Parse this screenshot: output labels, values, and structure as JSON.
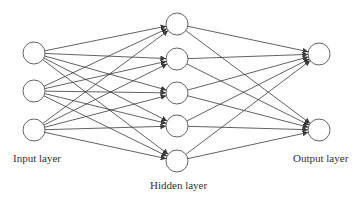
{
  "diagram": {
    "type": "feedforward-neural-network",
    "colors": {
      "line": "#3a3a3a",
      "node_fill": "#ffffff",
      "node_stroke": "#555555",
      "text": "#333333"
    },
    "node_radius": 11,
    "layers": [
      {
        "id": "input",
        "label": "Input layer",
        "x": 34,
        "nodes_y": [
          53,
          91,
          130
        ],
        "label_pos": [
          13,
          152
        ]
      },
      {
        "id": "hidden",
        "label": "Hidden layer",
        "x": 177,
        "nodes_y": [
          24,
          59,
          93,
          126,
          161
        ],
        "label_pos": [
          150,
          179
        ]
      },
      {
        "id": "output",
        "label": "Output layer",
        "x": 319,
        "nodes_y": [
          54,
          130
        ],
        "label_pos": [
          293,
          152
        ]
      }
    ],
    "connections": "fully-connected with arrowheads into next layer"
  }
}
